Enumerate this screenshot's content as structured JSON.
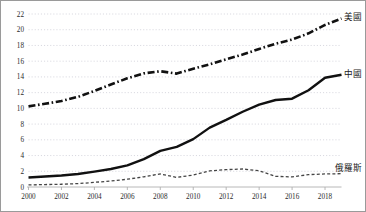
{
  "chart_data": {
    "type": "line",
    "title": "",
    "subtitle": "",
    "xlabel": "",
    "ylabel": "",
    "xlim": [
      2000,
      2019
    ],
    "ylim": [
      0,
      22
    ],
    "grid": true,
    "grid_style": "horizontal dotted",
    "legend_position": "inline-right-of-line-end",
    "x": [
      2000,
      2001,
      2002,
      2003,
      2004,
      2005,
      2006,
      2007,
      2008,
      2009,
      2010,
      2011,
      2012,
      2013,
      2014,
      2015,
      2016,
      2017,
      2018,
      2019
    ],
    "y_ticks": [
      0,
      2,
      4,
      6,
      8,
      10,
      12,
      14,
      16,
      18,
      20,
      22
    ],
    "x_ticks": [
      2000,
      2002,
      2004,
      2006,
      2008,
      2010,
      2012,
      2014,
      2016,
      2018
    ],
    "x_tick_labels": [
      "2000",
      "2002",
      "2004",
      "2006",
      "2008",
      "2010",
      "2012",
      "2014",
      "2016",
      "2018"
    ],
    "y_tick_labels": [
      "0",
      "2",
      "4",
      "6",
      "8",
      "10",
      "12",
      "14",
      "16",
      "18",
      "20",
      "22"
    ],
    "series": [
      {
        "name": "美國",
        "label": "美國",
        "style": "dash-dot",
        "color": "#111111",
        "width": 2.6,
        "label_x": 2019,
        "label_y": 21.6,
        "values": [
          10.25,
          10.58,
          10.94,
          11.46,
          12.21,
          13.04,
          13.82,
          14.45,
          14.72,
          14.42,
          15.05,
          15.6,
          16.25,
          16.84,
          17.55,
          18.22,
          18.75,
          19.54,
          20.61,
          21.43
        ]
      },
      {
        "name": "中國",
        "label": "中國",
        "style": "solid",
        "color": "#111111",
        "width": 2.4,
        "label_x": 2019,
        "label_y": 14.4,
        "values": [
          1.21,
          1.34,
          1.47,
          1.66,
          1.96,
          2.29,
          2.75,
          3.55,
          4.59,
          5.11,
          6.09,
          7.55,
          8.53,
          9.57,
          10.48,
          11.06,
          11.23,
          12.31,
          13.89,
          14.28
        ]
      },
      {
        "name": "俄羅斯",
        "label": "俄羅斯",
        "style": "fine-dash",
        "color": "#444444",
        "width": 1.3,
        "label_x": 2019,
        "label_y": 2.5,
        "values": [
          0.26,
          0.31,
          0.35,
          0.43,
          0.59,
          0.76,
          0.99,
          1.3,
          1.66,
          1.22,
          1.52,
          2.05,
          2.21,
          2.29,
          2.06,
          1.36,
          1.28,
          1.57,
          1.66,
          1.69
        ]
      }
    ]
  },
  "axis": {
    "y_labels": [
      "22",
      "20",
      "18",
      "16",
      "14",
      "12",
      "10",
      "8",
      "6",
      "4",
      "2",
      "0"
    ],
    "x_labels": [
      "2000",
      "2002",
      "2004",
      "2006",
      "2008",
      "2010",
      "2012",
      "2014",
      "2016",
      "2018"
    ]
  },
  "labels": {
    "us": "美國",
    "china": "中國",
    "russia": "俄羅斯"
  },
  "colors": {
    "border": "#9a9a9a",
    "grid": "#cfcfd8",
    "axis": "#b0b0b0",
    "line_dark": "#111111",
    "line_gray": "#444444",
    "text": "#2b2b2b"
  }
}
